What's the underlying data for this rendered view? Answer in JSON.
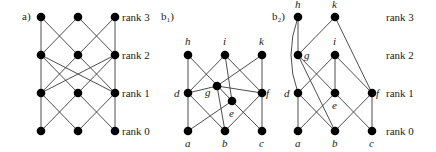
{
  "panels": [
    {
      "id": "a",
      "label": "a)",
      "label_pos": [
        22,
        20
      ],
      "nodes": [
        {
          "id": "a30",
          "x": 41,
          "y": 17
        },
        {
          "id": "a31",
          "x": 78,
          "y": 17
        },
        {
          "id": "a32",
          "x": 115,
          "y": 17
        },
        {
          "id": "a20",
          "x": 41,
          "y": 55
        },
        {
          "id": "a21",
          "x": 78,
          "y": 55
        },
        {
          "id": "a22",
          "x": 115,
          "y": 55
        },
        {
          "id": "a10",
          "x": 41,
          "y": 93
        },
        {
          "id": "a11",
          "x": 78,
          "y": 93
        },
        {
          "id": "a12",
          "x": 115,
          "y": 93
        },
        {
          "id": "a00",
          "x": 41,
          "y": 131
        },
        {
          "id": "a01",
          "x": 78,
          "y": 131
        },
        {
          "id": "a02",
          "x": 115,
          "y": 131
        }
      ],
      "edges": [
        [
          "a30",
          "a20"
        ],
        [
          "a30",
          "a21"
        ],
        [
          "a31",
          "a20"
        ],
        [
          "a31",
          "a22"
        ],
        [
          "a32",
          "a21"
        ],
        [
          "a32",
          "a22"
        ],
        [
          "a20",
          "a10"
        ],
        [
          "a20",
          "a11"
        ],
        [
          "a20",
          "a12"
        ],
        [
          "a21",
          "a12"
        ],
        [
          "a22",
          "a10"
        ],
        [
          "a22",
          "a11"
        ],
        [
          "a22",
          "a12"
        ],
        [
          "a21",
          "a10"
        ],
        [
          "a10",
          "a00"
        ],
        [
          "a10",
          "a01"
        ],
        [
          "a11",
          "a00"
        ],
        [
          "a11",
          "a02"
        ],
        [
          "a12",
          "a01"
        ],
        [
          "a12",
          "a02"
        ]
      ],
      "node_labels": []
    },
    {
      "id": "b1",
      "label": "b₁)",
      "label_pos": [
        161,
        20
      ],
      "nodes": [
        {
          "id": "h",
          "x": 188,
          "y": 55
        },
        {
          "id": "i",
          "x": 225,
          "y": 55
        },
        {
          "id": "k",
          "x": 262,
          "y": 55
        },
        {
          "id": "g",
          "x": 217,
          "y": 86
        },
        {
          "id": "e",
          "x": 232,
          "y": 101
        },
        {
          "id": "d",
          "x": 188,
          "y": 93
        },
        {
          "id": "f",
          "x": 262,
          "y": 93
        },
        {
          "id": "a",
          "x": 188,
          "y": 131
        },
        {
          "id": "b",
          "x": 225,
          "y": 131
        },
        {
          "id": "c",
          "x": 262,
          "y": 131
        }
      ],
      "edges": [
        [
          "h",
          "d"
        ],
        [
          "h",
          "e"
        ],
        [
          "i",
          "d"
        ],
        [
          "i",
          "e"
        ],
        [
          "i",
          "f"
        ],
        [
          "k",
          "g"
        ],
        [
          "k",
          "f"
        ],
        [
          "g",
          "d"
        ],
        [
          "g",
          "b"
        ],
        [
          "g",
          "f"
        ],
        [
          "e",
          "a"
        ],
        [
          "e",
          "c"
        ],
        [
          "d",
          "a"
        ],
        [
          "d",
          "b"
        ],
        [
          "f",
          "b"
        ],
        [
          "f",
          "c"
        ]
      ],
      "node_labels": [
        {
          "text": "h",
          "x": 185,
          "y": 45
        },
        {
          "text": "i",
          "x": 223,
          "y": 45
        },
        {
          "text": "k",
          "x": 259,
          "y": 45
        },
        {
          "text": "d",
          "x": 174,
          "y": 97
        },
        {
          "text": "g",
          "x": 205,
          "y": 96
        },
        {
          "text": "e",
          "x": 229,
          "y": 117
        },
        {
          "text": "f",
          "x": 266,
          "y": 97
        },
        {
          "text": "a",
          "x": 185,
          "y": 147
        },
        {
          "text": "b",
          "x": 222,
          "y": 147
        },
        {
          "text": "c",
          "x": 259,
          "y": 147
        }
      ]
    },
    {
      "id": "b2",
      "label": "b₂)",
      "label_pos": [
        272,
        20
      ],
      "nodes": [
        {
          "id": "h",
          "x": 298,
          "y": 17
        },
        {
          "id": "k",
          "x": 335,
          "y": 17
        },
        {
          "id": "g",
          "x": 298,
          "y": 55
        },
        {
          "id": "i",
          "x": 335,
          "y": 55
        },
        {
          "id": "d",
          "x": 298,
          "y": 93
        },
        {
          "id": "e",
          "x": 335,
          "y": 93
        },
        {
          "id": "f",
          "x": 372,
          "y": 93
        },
        {
          "id": "a",
          "x": 298,
          "y": 131
        },
        {
          "id": "b",
          "x": 335,
          "y": 131
        },
        {
          "id": "c",
          "x": 372,
          "y": 131
        }
      ],
      "edges": [
        [
          "h",
          "g"
        ],
        [
          "k",
          "g"
        ],
        [
          "k",
          "f"
        ],
        [
          "g",
          "e"
        ],
        [
          "g",
          "b"
        ],
        [
          "i",
          "d"
        ],
        [
          "i",
          "e"
        ],
        [
          "i",
          "f"
        ],
        [
          "d",
          "a"
        ],
        [
          "d",
          "b"
        ],
        [
          "e",
          "a"
        ],
        [
          "e",
          "c"
        ],
        [
          "f",
          "b"
        ],
        [
          "f",
          "c"
        ]
      ],
      "curved_edges": [
        {
          "from": "h",
          "to": "d",
          "ctrl": [
            284,
            55
          ]
        }
      ],
      "node_labels": [
        {
          "text": "h",
          "x": 295,
          "y": 8
        },
        {
          "text": "k",
          "x": 332,
          "y": 8
        },
        {
          "text": "g",
          "x": 304,
          "y": 59
        },
        {
          "text": "i",
          "x": 333,
          "y": 45
        },
        {
          "text": "d",
          "x": 284,
          "y": 97
        },
        {
          "text": "e",
          "x": 332,
          "y": 109
        },
        {
          "text": "f",
          "x": 376,
          "y": 97
        },
        {
          "text": "a",
          "x": 295,
          "y": 147
        },
        {
          "text": "b",
          "x": 332,
          "y": 147
        },
        {
          "text": "c",
          "x": 369,
          "y": 147
        }
      ]
    }
  ],
  "rank_labels": {
    "left": [
      {
        "text": "rank 3",
        "x": 122,
        "y": 21
      },
      {
        "text": "rank 2",
        "x": 122,
        "y": 59
      },
      {
        "text": "rank 1",
        "x": 122,
        "y": 97
      },
      {
        "text": "rank 0",
        "x": 122,
        "y": 135
      }
    ],
    "right": [
      {
        "text": "rank 3",
        "x": 386,
        "y": 21
      },
      {
        "text": "rank 2",
        "x": 386,
        "y": 59
      },
      {
        "text": "rank 1",
        "x": 386,
        "y": 97
      },
      {
        "text": "rank 0",
        "x": 386,
        "y": 135
      }
    ]
  },
  "style": {
    "node_radius": 4.3,
    "node_color": "#000000",
    "edge_color": "#3a3a3a"
  }
}
